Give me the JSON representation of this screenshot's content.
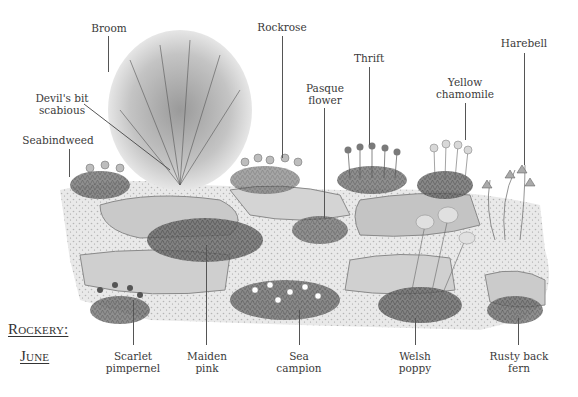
{
  "title": {
    "line1": "Rockery:",
    "line2": "June"
  },
  "labels": {
    "top": [
      {
        "id": "broom",
        "text": [
          "Broom"
        ]
      },
      {
        "id": "devils-bit-scabious",
        "text": [
          "Devil's bit",
          "scabious"
        ]
      },
      {
        "id": "seabindweed",
        "text": [
          "Seabindweed"
        ]
      },
      {
        "id": "rockrose",
        "text": [
          "Rockrose"
        ]
      },
      {
        "id": "pasque-flower",
        "text": [
          "Pasque",
          "flower"
        ]
      },
      {
        "id": "thrift",
        "text": [
          "Thrift"
        ]
      },
      {
        "id": "yellow-chamomile",
        "text": [
          "Yellow",
          "chamomile"
        ]
      },
      {
        "id": "harebell",
        "text": [
          "Harebell"
        ]
      }
    ],
    "bottom": [
      {
        "id": "scarlet-pimpernel",
        "text": [
          "Scarlet",
          "pimpernel"
        ]
      },
      {
        "id": "maiden-pink",
        "text": [
          "Maiden",
          "pink"
        ]
      },
      {
        "id": "sea-campion",
        "text": [
          "Sea",
          "campion"
        ]
      },
      {
        "id": "welsh-poppy",
        "text": [
          "Welsh",
          "poppy"
        ]
      },
      {
        "id": "rusty-back-fern",
        "text": [
          "Rusty back",
          "fern"
        ]
      }
    ]
  }
}
